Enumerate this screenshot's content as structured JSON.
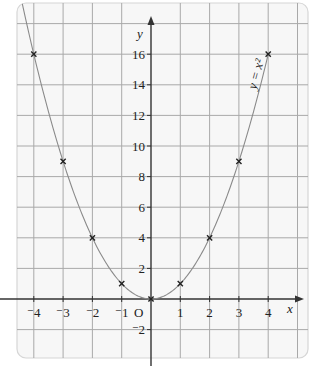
{
  "chart_data": {
    "type": "line",
    "title": "",
    "xlabel": "x",
    "ylabel": "y",
    "origin_label": "O",
    "curve_label": "y = x²",
    "equation": "y = x^2",
    "x_ticks": [
      -4,
      -3,
      -2,
      -1,
      1,
      2,
      3,
      4
    ],
    "x_tick_labels": [
      "⁻4",
      "⁻3",
      "⁻2",
      "⁻1",
      "1",
      "2",
      "3",
      "4"
    ],
    "y_ticks": [
      -2,
      2,
      4,
      6,
      8,
      10,
      12,
      14,
      16
    ],
    "y_tick_labels": [
      "⁻2",
      "2",
      "4",
      "6",
      "8",
      "10",
      "12",
      "14",
      "16"
    ],
    "xlim": [
      -4.5,
      4.9
    ],
    "ylim": [
      -3.6,
      19
    ],
    "grid": true,
    "legend": "none",
    "series": [
      {
        "name": "y = x²",
        "style": "smooth curve with cross markers",
        "x": [
          -4,
          -3,
          -2,
          -1,
          0,
          1,
          2,
          3,
          4
        ],
        "y": [
          16,
          9,
          4,
          1,
          0,
          1,
          4,
          9,
          16
        ]
      }
    ],
    "colors": {
      "grid": "#a9a9a9",
      "axis": "#333333",
      "curve": "#8a8a8a",
      "marker": "#222222",
      "background": "#f7f7f7"
    }
  }
}
